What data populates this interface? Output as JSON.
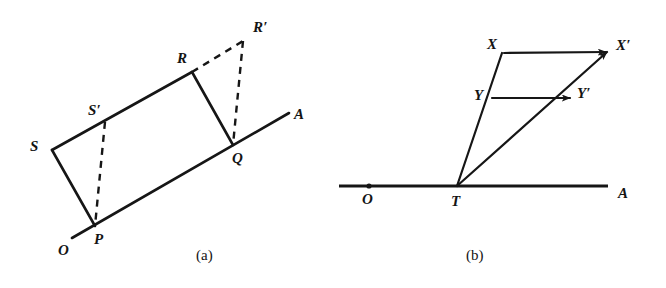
{
  "figure": {
    "background_color": "#ffffff",
    "ink_color": "#161616",
    "panels": [
      {
        "id": "panel-a",
        "caption": "(a)",
        "caption_x": 205,
        "caption_y": 255,
        "description": "Parallelogram OPRS sheared along ray OA: rectangle-like quadrilateral S-R-Q-P with dashed shear construction to R'",
        "points": [
          {
            "name": "O",
            "label": "O",
            "x": 72,
            "y": 238,
            "label_x": 58,
            "label_y": 243,
            "has_dot": false
          },
          {
            "name": "P",
            "label": "P",
            "x": 95,
            "y": 226,
            "label_x": 94,
            "label_y": 232,
            "has_dot": false
          },
          {
            "name": "S",
            "label": "S",
            "x": 52,
            "y": 150,
            "label_x": 30,
            "label_y": 139,
            "has_dot": false
          },
          {
            "name": "S-prime",
            "label": "S′",
            "x": 105,
            "y": 122,
            "label_x": 88,
            "label_y": 103,
            "has_dot": false
          },
          {
            "name": "R",
            "label": "R",
            "x": 192,
            "y": 72,
            "label_x": 177,
            "label_y": 51,
            "has_dot": false
          },
          {
            "name": "Q",
            "label": "Q",
            "x": 233,
            "y": 145,
            "label_x": 232,
            "label_y": 151,
            "has_dot": false
          },
          {
            "name": "R-prime",
            "label": "R′",
            "x": 243,
            "y": 41,
            "label_x": 253,
            "label_y": 20,
            "has_dot": false
          },
          {
            "name": "A",
            "label": "A",
            "x": 289,
            "y": 113,
            "label_x": 294,
            "label_y": 107,
            "has_dot": false
          }
        ],
        "solid_segments": [
          {
            "name": "ray-O-A",
            "x1": 72,
            "y1": 238,
            "x2": 289,
            "y2": 113
          },
          {
            "name": "side-P-S",
            "x1": 95,
            "y1": 226,
            "x2": 52,
            "y2": 150
          },
          {
            "name": "side-S-R",
            "x1": 52,
            "y1": 150,
            "x2": 192,
            "y2": 72
          },
          {
            "name": "side-R-Q",
            "x1": 192,
            "y1": 72,
            "x2": 233,
            "y2": 145
          }
        ],
        "dashed_segments": [
          {
            "name": "dashed-S-prime-P",
            "x1": 105,
            "y1": 122,
            "x2": 95,
            "y2": 226
          },
          {
            "name": "dashed-R-R-prime",
            "x1": 192,
            "y1": 72,
            "x2": 243,
            "y2": 41
          },
          {
            "name": "dashed-R-prime-Q",
            "x1": 243,
            "y1": 41,
            "x2": 233,
            "y2": 145
          }
        ],
        "arrows": []
      },
      {
        "id": "panel-b",
        "caption": "(b)",
        "caption_x": 475,
        "caption_y": 255,
        "description": "Shear from point T on line OA: rays T-X and T-X' with horizontal displacement arrows X to X' and Y to Y'",
        "points": [
          {
            "name": "O",
            "label": "O",
            "x": 369,
            "y": 186,
            "label_x": 362,
            "label_y": 192,
            "has_dot": true
          },
          {
            "name": "T",
            "label": "T",
            "x": 457,
            "y": 186,
            "label_x": 451,
            "label_y": 194,
            "has_dot": false
          },
          {
            "name": "A",
            "label": "A",
            "x": 608,
            "y": 186,
            "label_x": 618,
            "label_y": 186,
            "has_dot": false
          },
          {
            "name": "X",
            "label": "X",
            "x": 502,
            "y": 53,
            "label_x": 487,
            "label_y": 37,
            "has_dot": false
          },
          {
            "name": "X-prime",
            "label": "X′",
            "x": 607,
            "y": 52,
            "label_x": 616,
            "label_y": 38,
            "has_dot": false
          },
          {
            "name": "Y",
            "label": "Y",
            "x": 490,
            "y": 98,
            "label_x": 474,
            "label_y": 88,
            "has_dot": false
          },
          {
            "name": "Y-prime",
            "label": "Y′",
            "x": 568,
            "y": 98,
            "label_x": 577,
            "label_y": 86,
            "has_dot": false
          }
        ],
        "solid_segments": [
          {
            "name": "ray-T-X",
            "x1": 457,
            "y1": 186,
            "x2": 502,
            "y2": 53
          },
          {
            "name": "ray-T-X-prime",
            "x1": 457,
            "y1": 186,
            "x2": 607,
            "y2": 52
          }
        ],
        "baseline_segments": [
          {
            "name": "line-O-A",
            "x1": 339,
            "y1": 186,
            "x2": 608,
            "y2": 186
          }
        ],
        "dashed_segments": [],
        "arrows": [
          {
            "name": "arrow-X-to-X-prime",
            "x1": 502,
            "y1": 53,
            "x2": 607,
            "y2": 52
          },
          {
            "name": "arrow-Y-to-Y-prime",
            "x1": 490,
            "y1": 98,
            "x2": 570,
            "y2": 98
          }
        ]
      }
    ]
  }
}
